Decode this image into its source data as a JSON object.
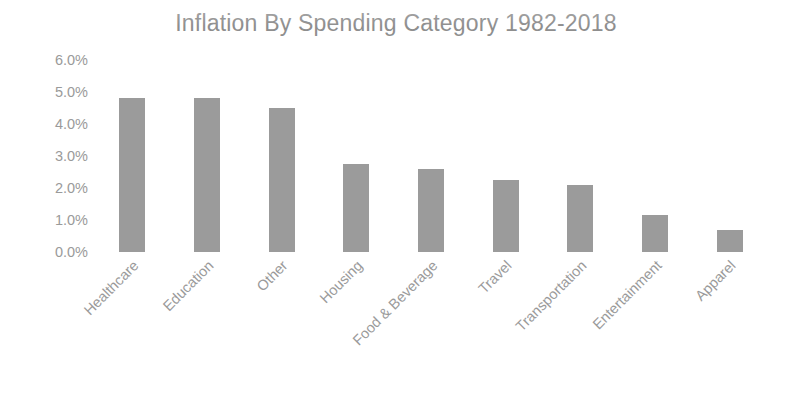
{
  "chart_data": {
    "type": "bar",
    "title": "Inflation By Spending Category 1982-2018",
    "xlabel": "",
    "ylabel": "",
    "categories": [
      "Healthcare",
      "Education",
      "Other",
      "Housing",
      "Food & Beverage",
      "Travel",
      "Transportation",
      "Entertainment",
      "Apparel"
    ],
    "values": [
      4.8,
      4.8,
      4.5,
      2.75,
      2.6,
      2.25,
      2.1,
      1.15,
      0.7
    ],
    "value_unit": "%",
    "ylim": [
      0.0,
      6.0
    ],
    "ytick_values": [
      6.0,
      5.0,
      4.0,
      3.0,
      2.0,
      1.0,
      0.0
    ],
    "ytick_labels": [
      "6.0%",
      "5.0%",
      "4.0%",
      "3.0%",
      "2.0%",
      "1.0%",
      "0.0%"
    ],
    "grid": false,
    "legend": false,
    "legend_position": "none",
    "bar_color": "#9b9b9b",
    "title_color": "#8e8e8e",
    "tick_label_color": "#9a9a9a",
    "x_label_rotation_deg": -45,
    "background_color": "#ffffff"
  }
}
